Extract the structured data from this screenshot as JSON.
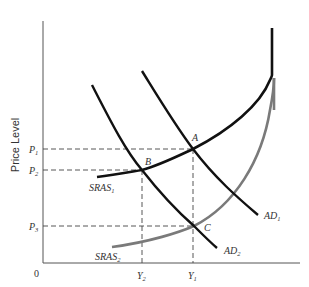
{
  "diagram": {
    "type": "aggregate-demand-aggregate-supply",
    "y_axis_label": "Price Level",
    "origin_label": "0",
    "price_levels": [
      {
        "base": "P",
        "sub": "1"
      },
      {
        "base": "P",
        "sub": "2"
      },
      {
        "base": "P",
        "sub": "3"
      }
    ],
    "outputs": [
      {
        "base": "Y",
        "sub": "2"
      },
      {
        "base": "Y",
        "sub": "1"
      }
    ],
    "points": [
      {
        "label": "A"
      },
      {
        "label": "B"
      },
      {
        "label": "C"
      }
    ],
    "curves": [
      {
        "base": "SRAS",
        "sub": "1",
        "color": "#111111"
      },
      {
        "base": "SRAS",
        "sub": "2",
        "color": "#7a7a7a"
      },
      {
        "base": "AD",
        "sub": "1",
        "color": "#111111"
      },
      {
        "base": "AD",
        "sub": "2",
        "color": "#111111"
      }
    ]
  }
}
